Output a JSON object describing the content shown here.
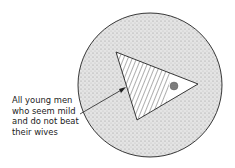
{
  "diagram": {
    "type": "venn-subset",
    "regions": [
      {
        "name": "outer-set",
        "style": "stippled"
      },
      {
        "name": "triangle-subset",
        "style": "hatched-with-white-tip"
      },
      {
        "name": "small-dot",
        "style": "dark-stippled"
      }
    ],
    "label": {
      "lines": [
        "All young men",
        "who seem mild",
        "and do not beat",
        "their wives"
      ]
    },
    "colors": {
      "stipple": "#d6d6d6",
      "outline": "#222222",
      "dot": "#7a7a7a"
    }
  }
}
